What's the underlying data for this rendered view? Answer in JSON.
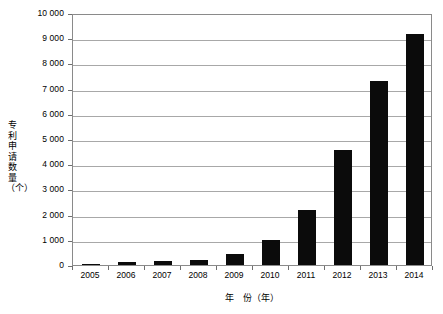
{
  "chart_data": {
    "type": "bar",
    "title": "",
    "xlabel": "年　份（年）",
    "ylabel": "专利申请数量（个）",
    "categories": [
      "2005",
      "2006",
      "2007",
      "2008",
      "2009",
      "2010",
      "2011",
      "2012",
      "2013",
      "2014"
    ],
    "values": [
      60,
      110,
      160,
      200,
      450,
      1000,
      2200,
      4550,
      7300,
      9150
    ],
    "series": [
      {
        "name": "专利申请数量",
        "values": [
          60,
          110,
          160,
          200,
          450,
          1000,
          2200,
          4550,
          7300,
          9150
        ]
      }
    ],
    "ylim": [
      0,
      10000
    ],
    "ytick_values": [
      0,
      1000,
      2000,
      3000,
      4000,
      5000,
      6000,
      7000,
      8000,
      9000,
      10000
    ],
    "ytick_labels": [
      "0",
      "1 000",
      "2 000",
      "3 000",
      "4 000",
      "5 000",
      "6 000",
      "7 000",
      "8 000",
      "9 000",
      "10 000"
    ],
    "grid": true,
    "legend": "none",
    "bar_color": "#0b0b0b",
    "grid_color": "#a8a8a8",
    "frame_color": "#8a8a8a"
  }
}
